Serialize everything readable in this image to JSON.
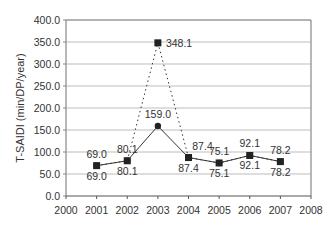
{
  "chart_data": {
    "type": "line",
    "title": "",
    "xlabel": "",
    "ylabel": "T-SAIDI (min/DP/year)",
    "x": [
      2001,
      2002,
      2003,
      2004,
      2005,
      2006,
      2007
    ],
    "xlim": [
      2000,
      2008
    ],
    "ylim": [
      0,
      400
    ],
    "x_ticks": [
      "2000",
      "2001",
      "2002",
      "2003",
      "2004",
      "2005",
      "2006",
      "2007",
      "2008"
    ],
    "y_ticks": [
      "0.0",
      "50.0",
      "100.0",
      "150.0",
      "200.0",
      "250.0",
      "300.0",
      "350.0",
      "400.0"
    ],
    "grid": "horizontal",
    "legend": null,
    "series": [
      {
        "name": "Dashed series (square markers)",
        "style": "dashed",
        "marker": "square",
        "values": [
          69.0,
          80.1,
          348.1,
          87.4,
          75.1,
          92.1,
          78.2
        ],
        "labels": [
          "69.0",
          "80.1",
          "348.1",
          "87.4",
          "75.1",
          "92.1",
          "78.2"
        ]
      },
      {
        "name": "Solid series (circle markers)",
        "style": "solid",
        "marker": "circle",
        "values": [
          69.0,
          80.1,
          159.0,
          87.4,
          75.1,
          92.1,
          78.2
        ],
        "labels": [
          "69.0",
          "80.1",
          "159.0",
          "87.4",
          "75.1",
          "92.1",
          "78.2"
        ]
      }
    ]
  },
  "colors": {
    "line": "#333333",
    "grid": "#bdbdbd",
    "axis": "#888888",
    "text": "#333333"
  }
}
